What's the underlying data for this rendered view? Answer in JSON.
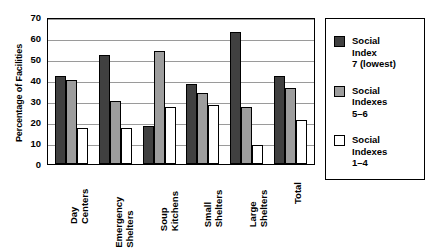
{
  "chart_data": {
    "type": "bar",
    "title": "",
    "xlabel": "",
    "ylabel": "Percentage of Facilities",
    "ylim": [
      0,
      70
    ],
    "ytick_step": 10,
    "yticks": [
      "70",
      "60",
      "50",
      "40",
      "30",
      "20",
      "10",
      "0"
    ],
    "grid": true,
    "legend_position": "right-outside",
    "categories": [
      "Day Centers",
      "Emergency Shelters",
      "Soup Kitchens",
      "Small Shelters",
      "Large Shelters",
      "Total"
    ],
    "category_lines": [
      [
        "Day",
        "Centers"
      ],
      [
        "Emergency",
        "Shelters"
      ],
      [
        "Soup",
        "Kitchens"
      ],
      [
        "Small",
        "Shelters"
      ],
      [
        "Large",
        "Shelters"
      ],
      [
        "Total"
      ]
    ],
    "series": [
      {
        "name": "Social Index 7 (lowest)",
        "name_lines": [
          "Social",
          "Index",
          "7 (lowest)"
        ],
        "color": "#404040",
        "values": [
          42,
          52,
          18,
          38,
          63,
          42
        ]
      },
      {
        "name": "Social Indexes 5–6",
        "name_lines": [
          "Social",
          "Indexes",
          "5–6"
        ],
        "color": "#9d9d9d",
        "values": [
          40,
          30,
          54,
          34,
          27,
          36
        ]
      },
      {
        "name": "Social Indexes 1–4",
        "name_lines": [
          "Social",
          "Indexes",
          "1–4"
        ],
        "color": "#ffffff",
        "values": [
          17,
          17,
          27,
          28,
          9,
          21
        ]
      }
    ]
  },
  "colors": {
    "axis": "#000000",
    "gridline": "#9a9a9a",
    "background": "#ffffff",
    "bar_border": "#000000"
  }
}
